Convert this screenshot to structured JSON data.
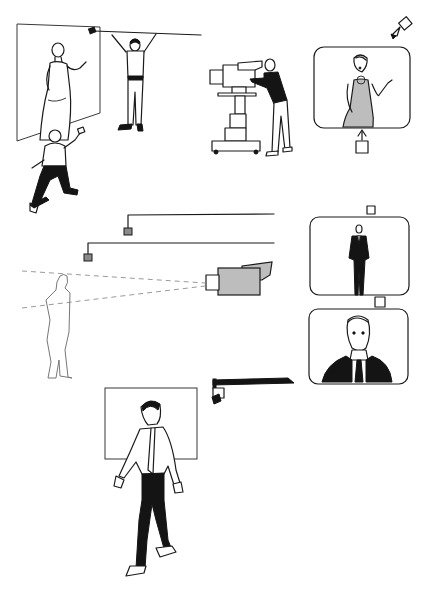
{
  "illustration": {
    "description": "Black-and-white line drawing of television studio production: lighting, boom microphones, cameras and monitors",
    "scenes": [
      {
        "id": "studio-set",
        "elements": [
          "backdrop-flat",
          "female-presenter",
          "boom-operator",
          "kneeling-lighting-technician"
        ]
      },
      {
        "id": "camera-operator",
        "elements": [
          "pedestal-camera",
          "camera-operator"
        ]
      },
      {
        "id": "monitor-presenter",
        "elements": [
          "monitor-frame",
          "presenter-on-screen",
          "spotlight",
          "small-camera-marker"
        ]
      },
      {
        "id": "shot-framing",
        "elements": [
          "ceiling-lights",
          "figure-outline",
          "studio-camera",
          "sightlines",
          "long-shot-monitor",
          "close-up-monitor"
        ]
      },
      {
        "id": "walking-man",
        "elements": [
          "frame-rectangle",
          "walking-man",
          "ceiling-camera-mount"
        ]
      }
    ]
  }
}
